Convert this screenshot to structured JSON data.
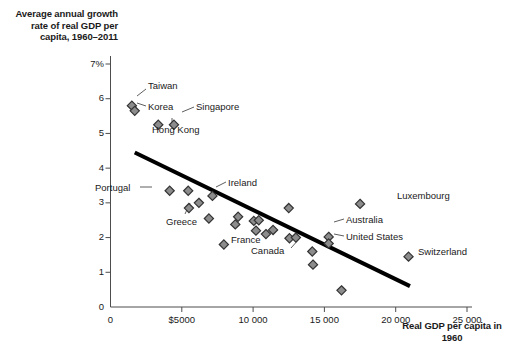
{
  "chart_data": {
    "type": "scatter",
    "title": "",
    "ylabel": "Average annual growth rate of real GDP per capita, 1960–2011",
    "xlabel": "Real GDP per capita in 1960",
    "xlim": [
      0,
      25000
    ],
    "ylim": [
      0,
      7
    ],
    "grid": false,
    "legend": "none",
    "xtick_labels": [
      "0",
      "$5000",
      "10 000",
      "15 000",
      "20 000",
      "25 000"
    ],
    "xtick_values": [
      0,
      5000,
      10000,
      15000,
      20000,
      25000
    ],
    "ytick_labels": [
      "0",
      "1",
      "2",
      "3",
      "4",
      "5",
      "6",
      "7%"
    ],
    "ytick_values": [
      0,
      1,
      2,
      3,
      4,
      5,
      6,
      7
    ],
    "marker_fill": "#8c8c8c",
    "marker_edge": "#333333",
    "marker_shape": "diamond",
    "trendline": {
      "color": "#000000",
      "width": 4,
      "x_start": 1700,
      "y_start": 4.45,
      "x_end": 21000,
      "y_end": 0.6
    },
    "points": [
      {
        "label": "Taiwan",
        "x": 1500,
        "y": 5.8,
        "labeled": true
      },
      {
        "label": "Korea",
        "x": 1700,
        "y": 5.65,
        "labeled": true
      },
      {
        "label": "Hong Kong",
        "x": 3350,
        "y": 5.25,
        "labeled": true
      },
      {
        "label": "Singapore",
        "x": 4450,
        "y": 5.25,
        "labeled": true
      },
      {
        "label": "Portugal",
        "x": 4150,
        "y": 3.35,
        "labeled": true
      },
      {
        "label": "",
        "x": 5450,
        "y": 3.35,
        "labeled": false
      },
      {
        "label": "Greece",
        "x": 5500,
        "y": 2.85,
        "labeled": true
      },
      {
        "label": "",
        "x": 6200,
        "y": 3.0,
        "labeled": false
      },
      {
        "label": "Ireland",
        "x": 7150,
        "y": 3.2,
        "labeled": true
      },
      {
        "label": "",
        "x": 6900,
        "y": 2.55,
        "labeled": false
      },
      {
        "label": "France",
        "x": 7950,
        "y": 1.8,
        "labeled": true
      },
      {
        "label": "",
        "x": 8750,
        "y": 2.38,
        "labeled": false
      },
      {
        "label": "",
        "x": 8950,
        "y": 2.6,
        "labeled": false
      },
      {
        "label": "",
        "x": 10050,
        "y": 2.48,
        "labeled": false
      },
      {
        "label": "",
        "x": 10400,
        "y": 2.5,
        "labeled": false
      },
      {
        "label": "",
        "x": 10200,
        "y": 2.2,
        "labeled": false
      },
      {
        "label": "",
        "x": 10900,
        "y": 2.1,
        "labeled": false
      },
      {
        "label": "",
        "x": 11400,
        "y": 2.22,
        "labeled": false
      },
      {
        "label": "",
        "x": 12500,
        "y": 2.85,
        "labeled": false
      },
      {
        "label": "Canada",
        "x": 12550,
        "y": 1.98,
        "labeled": true
      },
      {
        "label": "",
        "x": 13000,
        "y": 2.0,
        "labeled": false
      },
      {
        "label": "",
        "x": 14150,
        "y": 1.6,
        "labeled": false
      },
      {
        "label": "",
        "x": 14200,
        "y": 1.22,
        "labeled": false
      },
      {
        "label": "Australia",
        "x": 15300,
        "y": 2.02,
        "labeled": true
      },
      {
        "label": "United States",
        "x": 15300,
        "y": 1.83,
        "labeled": true
      },
      {
        "label": "Luxembourg",
        "x": 17500,
        "y": 2.97,
        "labeled": true
      },
      {
        "label": "",
        "x": 16200,
        "y": 0.48,
        "labeled": false
      },
      {
        "label": "Switzerland",
        "x": 20900,
        "y": 1.45,
        "labeled": true
      }
    ],
    "annotations": [
      {
        "name": "Taiwan",
        "text": "Taiwan"
      },
      {
        "name": "Korea",
        "text": "Korea"
      },
      {
        "name": "Hong Kong",
        "text": "Hong Kong"
      },
      {
        "name": "Singapore",
        "text": "Singapore"
      },
      {
        "name": "Portugal",
        "text": "Portugal"
      },
      {
        "name": "Greece",
        "text": "Greece"
      },
      {
        "name": "Ireland",
        "text": "Ireland"
      },
      {
        "name": "France",
        "text": "France"
      },
      {
        "name": "Canada",
        "text": "Canada"
      },
      {
        "name": "Australia",
        "text": "Australia"
      },
      {
        "name": "United States",
        "text": "United States"
      },
      {
        "name": "Luxembourg",
        "text": "Luxembourg"
      },
      {
        "name": "Switzerland",
        "text": "Switzerland"
      }
    ]
  }
}
